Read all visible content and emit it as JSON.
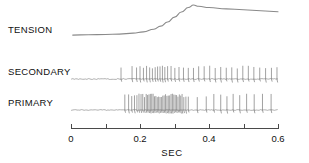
{
  "figure": {
    "background_color": "#ffffff",
    "trace_color": "#8a8a8a",
    "axis_color": "#4a4a4a",
    "text_color": "#111111"
  },
  "rows": [
    {
      "id": "tension",
      "label": "TENSION",
      "label_x": 8,
      "label_y": 33,
      "baseline_y": 37
    },
    {
      "id": "secondary",
      "label": "SECONDARY",
      "label_x": 8,
      "label_y": 75,
      "baseline_y": 79
    },
    {
      "id": "primary",
      "label": "PRIMARY",
      "label_x": 8,
      "label_y": 106,
      "baseline_y": 110
    }
  ],
  "axis": {
    "title": "SEC",
    "title_x": 172,
    "title_y": 156,
    "x_start_px": 71,
    "x_end_px": 278,
    "y_px": 128,
    "tick_length": 5,
    "major_ticks": [
      0,
      0.1,
      0.2,
      0.3,
      0.4,
      0.5,
      0.6
    ],
    "labeled_ticks": [
      {
        "value": 0,
        "text": "0"
      },
      {
        "value": 0.2,
        "text": "0.2"
      },
      {
        "value": 0.4,
        "text": "0.4"
      },
      {
        "value": 0.6,
        "text": "0.6"
      }
    ],
    "label_y": 142,
    "xlim": [
      0,
      0.6
    ],
    "units": "SEC"
  },
  "chart_data": {
    "type": "line",
    "xlabel": "SEC",
    "ylabel": "",
    "xlim": [
      0,
      0.6
    ],
    "grid": false,
    "legend": "none",
    "series": [
      {
        "name": "TENSION",
        "type": "line",
        "description": "Smooth tension record: flat baseline, steep rise beginning near 0.23 s, peak near 0.36 s, then slow decay.",
        "points_xy": [
          [
            0.005,
            0.06
          ],
          [
            0.05,
            0.07
          ],
          [
            0.1,
            0.08
          ],
          [
            0.14,
            0.09
          ],
          [
            0.18,
            0.12
          ],
          [
            0.21,
            0.16
          ],
          [
            0.24,
            0.24
          ],
          [
            0.26,
            0.34
          ],
          [
            0.28,
            0.47
          ],
          [
            0.3,
            0.62
          ],
          [
            0.32,
            0.78
          ],
          [
            0.34,
            0.92
          ],
          [
            0.355,
            1.0
          ],
          [
            0.37,
            0.96
          ],
          [
            0.4,
            0.92
          ],
          [
            0.45,
            0.88
          ],
          [
            0.5,
            0.85
          ],
          [
            0.55,
            0.82
          ],
          [
            0.6,
            0.79
          ]
        ]
      },
      {
        "name": "SECONDARY",
        "type": "spike-train",
        "description": "Secondary afferent spike train: sparse low-amplitude activity before 0.14 s, one early spike near 0.145 s, then a regular train from about 0.175 s to the end of the record.",
        "spike_times": [
          0.145,
          0.177,
          0.19,
          0.2,
          0.21,
          0.219,
          0.228,
          0.236,
          0.244,
          0.251,
          0.258,
          0.265,
          0.272,
          0.28,
          0.29,
          0.301,
          0.313,
          0.326,
          0.34,
          0.355,
          0.37,
          0.386,
          0.402,
          0.418,
          0.434,
          0.45,
          0.466,
          0.482,
          0.498,
          0.514,
          0.53,
          0.547,
          0.564,
          0.581,
          0.597
        ],
        "spike_count": 35
      },
      {
        "name": "PRIMARY",
        "type": "spike-train",
        "description": "Primary afferent spike train: silent baseline, abrupt high-frequency burst from about 0.155 s to 0.345 s during the dynamic phase of stretch, then a slower sustained discharge.",
        "spike_times": [
          0.156,
          0.167,
          0.176,
          0.184,
          0.191,
          0.197,
          0.203,
          0.208,
          0.213,
          0.218,
          0.222,
          0.226,
          0.23,
          0.234,
          0.238,
          0.242,
          0.246,
          0.25,
          0.254,
          0.258,
          0.262,
          0.266,
          0.27,
          0.274,
          0.278,
          0.282,
          0.286,
          0.29,
          0.294,
          0.298,
          0.302,
          0.306,
          0.31,
          0.314,
          0.318,
          0.322,
          0.327,
          0.333,
          0.34,
          0.366,
          0.392,
          0.414,
          0.434,
          0.452,
          0.47,
          0.489,
          0.509,
          0.531,
          0.555,
          0.58
        ],
        "spike_count": 50,
        "burst_window": [
          0.155,
          0.345
        ]
      }
    ]
  }
}
